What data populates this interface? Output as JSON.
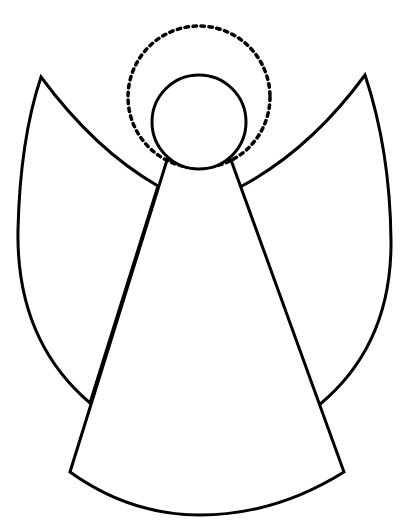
{
  "figure": {
    "width": 403,
    "height": 526,
    "colors": {
      "stroke": "#000000",
      "background": "#ffffff"
    },
    "parts": [
      {
        "name": "halo",
        "shape": "dashed-circle",
        "cx": 199,
        "cy": 97,
        "r": 71
      },
      {
        "name": "head",
        "shape": "circle",
        "cx": 199,
        "cy": 122,
        "r": 47
      },
      {
        "name": "left-wing",
        "shape": "wing",
        "tip": [
          41,
          77
        ],
        "top_join": [
          158,
          186
        ],
        "bottom_join": [
          90,
          403
        ]
      },
      {
        "name": "right-wing",
        "shape": "wing",
        "tip": [
          365,
          75
        ],
        "top_join": [
          240,
          187
        ],
        "bottom_join": [
          319,
          405
        ]
      },
      {
        "name": "robe",
        "shape": "cone",
        "top_left": [
          167,
          160
        ],
        "top_right": [
          231,
          160
        ],
        "bottom_left": [
          70,
          472
        ],
        "bottom_right": [
          344,
          472
        ],
        "bottom_mid": [
          200,
          515
        ]
      }
    ]
  }
}
